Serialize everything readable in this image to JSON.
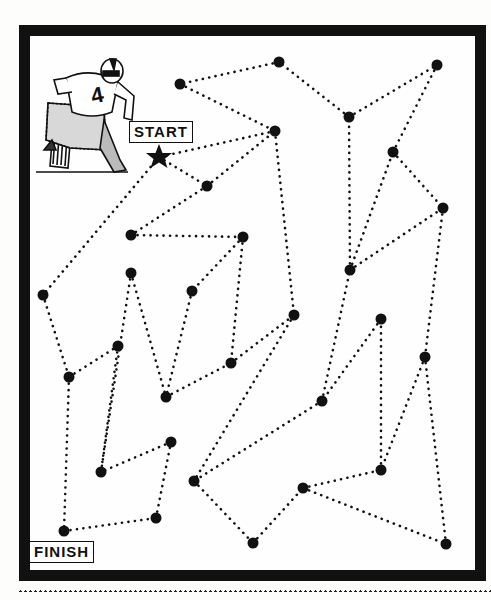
{
  "puzzle": {
    "type": "dot-to-dot maze",
    "start_label": "START",
    "finish_label": "FINISH",
    "rider_number": "4",
    "colors": {
      "ink": "#111111",
      "paper": "#fefefe"
    },
    "start_star": {
      "x": 159,
      "y": 157
    },
    "nodes": [
      {
        "id": "A",
        "x": 180,
        "y": 84
      },
      {
        "id": "B",
        "x": 279,
        "y": 62
      },
      {
        "id": "C",
        "x": 437,
        "y": 65
      },
      {
        "id": "D",
        "x": 349,
        "y": 117
      },
      {
        "id": "E",
        "x": 275,
        "y": 131
      },
      {
        "id": "F",
        "x": 393,
        "y": 152
      },
      {
        "id": "G",
        "x": 207,
        "y": 186
      },
      {
        "id": "H",
        "x": 443,
        "y": 208
      },
      {
        "id": "I",
        "x": 131,
        "y": 235
      },
      {
        "id": "J",
        "x": 243,
        "y": 237
      },
      {
        "id": "K",
        "x": 350,
        "y": 270
      },
      {
        "id": "L",
        "x": 43,
        "y": 295
      },
      {
        "id": "M",
        "x": 131,
        "y": 273
      },
      {
        "id": "N",
        "x": 192,
        "y": 291
      },
      {
        "id": "O",
        "x": 294,
        "y": 315
      },
      {
        "id": "P",
        "x": 381,
        "y": 319
      },
      {
        "id": "Q",
        "x": 118,
        "y": 346
      },
      {
        "id": "R",
        "x": 69,
        "y": 377
      },
      {
        "id": "S",
        "x": 231,
        "y": 363
      },
      {
        "id": "T",
        "x": 425,
        "y": 357
      },
      {
        "id": "U",
        "x": 166,
        "y": 397
      },
      {
        "id": "V",
        "x": 322,
        "y": 401
      },
      {
        "id": "W",
        "x": 171,
        "y": 442
      },
      {
        "id": "X",
        "x": 101,
        "y": 472
      },
      {
        "id": "Y",
        "x": 381,
        "y": 470
      },
      {
        "id": "Z",
        "x": 194,
        "y": 481
      },
      {
        "id": "AA",
        "x": 303,
        "y": 488
      },
      {
        "id": "AB",
        "x": 156,
        "y": 518
      },
      {
        "id": "AC",
        "x": 64,
        "y": 531
      },
      {
        "id": "AD",
        "x": 253,
        "y": 543
      },
      {
        "id": "AE",
        "x": 446,
        "y": 544
      }
    ],
    "edges": [
      [
        "STAR",
        "G"
      ],
      [
        "STAR",
        "L"
      ],
      [
        "G",
        "E"
      ],
      [
        "E",
        "O"
      ],
      [
        "G",
        "I"
      ],
      [
        "I",
        "J"
      ],
      [
        "J",
        "N"
      ],
      [
        "J",
        "S"
      ],
      [
        "N",
        "U"
      ],
      [
        "M",
        "U"
      ],
      [
        "M",
        "X"
      ],
      [
        "L",
        "R"
      ],
      [
        "R",
        "Q"
      ],
      [
        "Q",
        "X"
      ],
      [
        "R",
        "AC"
      ],
      [
        "AC",
        "AB"
      ],
      [
        "AB",
        "W"
      ],
      [
        "W",
        "X"
      ],
      [
        "U",
        "S"
      ],
      [
        "S",
        "O"
      ],
      [
        "O",
        "Z"
      ],
      [
        "Z",
        "AD"
      ],
      [
        "AD",
        "AA"
      ],
      [
        "AA",
        "Y"
      ],
      [
        "AA",
        "AE"
      ],
      [
        "AE",
        "T"
      ],
      [
        "T",
        "Y"
      ],
      [
        "Y",
        "P"
      ],
      [
        "P",
        "V"
      ],
      [
        "V",
        "Z"
      ],
      [
        "V",
        "K"
      ],
      [
        "K",
        "D"
      ],
      [
        "K",
        "F"
      ],
      [
        "K",
        "H"
      ],
      [
        "F",
        "H"
      ],
      [
        "F",
        "C"
      ],
      [
        "H",
        "T"
      ],
      [
        "D",
        "C"
      ],
      [
        "D",
        "B"
      ],
      [
        "B",
        "A"
      ],
      [
        "A",
        "E"
      ],
      [
        "E",
        "STAR"
      ]
    ]
  }
}
